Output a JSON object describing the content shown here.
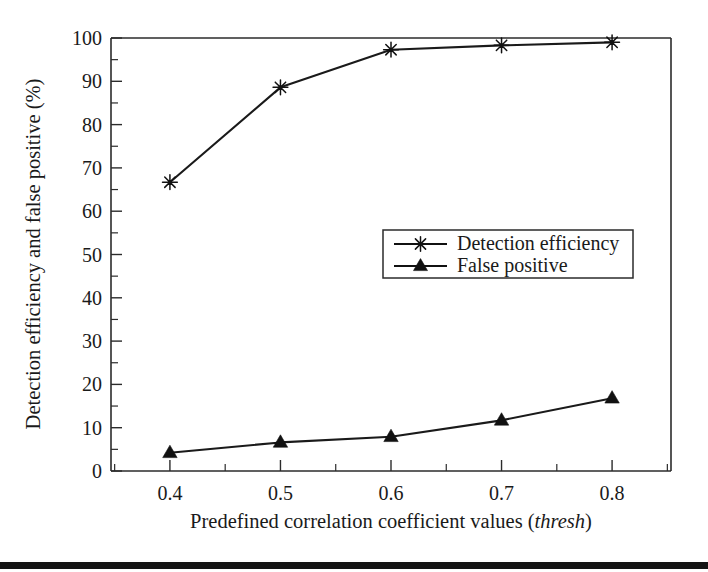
{
  "chart_data": {
    "type": "line",
    "title": "",
    "xlabel": "Predefined correlation coefficient values (thresh)",
    "xlabel_plain": "Predefined correlation coefficient values (",
    "xlabel_italic": "thresh",
    "xlabel_tail": ")",
    "ylabel": "Detection efficiency and false positive (%)",
    "x": [
      0.4,
      0.5,
      0.6,
      0.7,
      0.8
    ],
    "xticklabels": [
      "0.4",
      "0.5",
      "0.6",
      "0.7",
      "0.8"
    ],
    "yticklabels": [
      "0",
      "10",
      "20",
      "30",
      "40",
      "50",
      "60",
      "70",
      "80",
      "90",
      "100"
    ],
    "yticks": [
      0,
      10,
      20,
      30,
      40,
      50,
      60,
      70,
      80,
      90,
      100
    ],
    "xlim": [
      0.3467,
      0.8533
    ],
    "ylim": [
      0,
      100
    ],
    "grid": false,
    "minor_ticks": true,
    "legend_position": "center-right-inside",
    "series": [
      {
        "name": "Detection efficiency",
        "marker": "star",
        "values": [
          66.7,
          88.6,
          97.3,
          98.3,
          99.0
        ]
      },
      {
        "name": "False positive",
        "marker": "triangle-up",
        "values": [
          4.2,
          6.6,
          7.9,
          11.7,
          16.8
        ]
      }
    ],
    "colors": {
      "line": "#111111",
      "axis": "#2b2b2b",
      "background": "#ffffff",
      "footer_rule": "#141414"
    }
  },
  "legend": {
    "items": [
      {
        "label": "Detection efficiency",
        "marker": "star-icon"
      },
      {
        "label": "False positive",
        "marker": "triangle-icon"
      }
    ]
  }
}
